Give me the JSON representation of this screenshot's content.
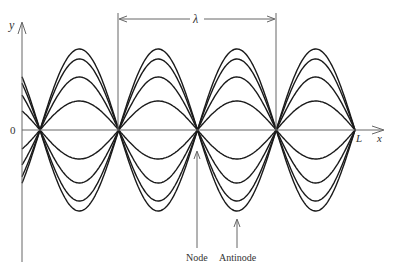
{
  "diagram": {
    "axes": {
      "y_label": "y",
      "x_label": "x",
      "origin_label": "0",
      "end_label": "L"
    },
    "wavelength_label": "λ",
    "annotations": {
      "node": "Node",
      "antinode": "Antinode"
    },
    "geometry": {
      "axis_x": 22,
      "axis_y": 130,
      "nodes_x": [
        40,
        118,
        197,
        276,
        355
      ],
      "amplitudes_px": [
        81,
        71,
        53,
        29
      ],
      "lambda_from_x": 118,
      "lambda_to_x": 276
    },
    "colors": {
      "curve": "#1a1a1a",
      "axis": "#666666",
      "text": "#333333"
    }
  }
}
